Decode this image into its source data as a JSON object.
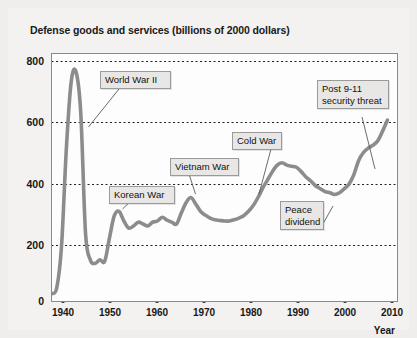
{
  "chart_title": "Defense goods and services (billions of 2000 dollars)",
  "axis": {
    "ylabel": "",
    "xlabel": "Year",
    "yticks": [
      "800",
      "600",
      "400",
      "200",
      "0"
    ],
    "xticks": [
      "1940",
      "1950",
      "1960",
      "1970",
      "1980",
      "1990",
      "2000",
      "2010"
    ]
  },
  "annotations": [
    {
      "id": "ww2",
      "label": "World War II"
    },
    {
      "id": "korean",
      "label": "Korean War"
    },
    {
      "id": "vietnam",
      "label": "Vietnam War"
    },
    {
      "id": "coldwar",
      "label": "Cold War"
    },
    {
      "id": "peace",
      "label": "Peace\ndividend"
    },
    {
      "id": "post911",
      "label": "Post 9-11\nsecurity threat"
    }
  ],
  "colors": {
    "line": "#8c8c8c",
    "plot_background": "#fdfdfd",
    "page_background": "#f3f2f0",
    "grid": "#1a1a1a",
    "annotation_fill": "#e8e7e5",
    "text": "#121212"
  },
  "chart_data": {
    "type": "line",
    "title": "Defense goods and services (billions of 2000 dollars)",
    "xlabel": "Year",
    "ylabel": "Billions of 2000 dollars",
    "xlim": [
      1939,
      2011
    ],
    "ylim": [
      0,
      840
    ],
    "grid": "horizontal dotted gridlines at 200, 400, 600, 800",
    "legend": "none",
    "series": [
      {
        "name": "Defense goods and services",
        "x": [
          1939,
          1940,
          1941,
          1942,
          1943,
          1944,
          1945,
          1946,
          1947,
          1948,
          1949,
          1950,
          1951,
          1952,
          1953,
          1954,
          1955,
          1956,
          1957,
          1958,
          1959,
          1960,
          1961,
          1962,
          1963,
          1964,
          1965,
          1966,
          1967,
          1968,
          1969,
          1970,
          1971,
          1972,
          1973,
          1974,
          1975,
          1976,
          1977,
          1978,
          1979,
          1980,
          1981,
          1982,
          1983,
          1984,
          1985,
          1986,
          1987,
          1988,
          1989,
          1990,
          1991,
          1992,
          1993,
          1994,
          1995,
          1996,
          1997,
          1998,
          1999,
          2000,
          2001,
          2002,
          2003,
          2004,
          2005,
          2006,
          2007,
          2008,
          2009
        ],
        "y": [
          25,
          45,
          190,
          520,
          745,
          780,
          640,
          230,
          140,
          128,
          140,
          135,
          215,
          290,
          305,
          272,
          248,
          255,
          268,
          262,
          255,
          268,
          272,
          285,
          275,
          268,
          262,
          300,
          335,
          352,
          330,
          305,
          292,
          282,
          276,
          274,
          272,
          272,
          276,
          282,
          290,
          305,
          325,
          352,
          385,
          412,
          440,
          462,
          470,
          462,
          458,
          455,
          440,
          422,
          408,
          392,
          382,
          372,
          368,
          362,
          368,
          382,
          398,
          430,
          478,
          505,
          520,
          530,
          545,
          578,
          615
        ]
      }
    ],
    "annotations": [
      {
        "text": "World War II",
        "points_to_year": 1945,
        "points_to_value": 640
      },
      {
        "text": "Korean War",
        "points_to_year": 1953,
        "points_to_value": 305
      },
      {
        "text": "Vietnam War",
        "points_to_year": 1968,
        "points_to_value": 352
      },
      {
        "text": "Cold War",
        "points_to_year": 1982,
        "points_to_value": 352
      },
      {
        "text": "Peace dividend",
        "points_to_year": 1992,
        "points_to_value": 422
      },
      {
        "text": "Post 9-11 security threat",
        "points_to_year": 2006,
        "points_to_value": 530
      }
    ]
  }
}
